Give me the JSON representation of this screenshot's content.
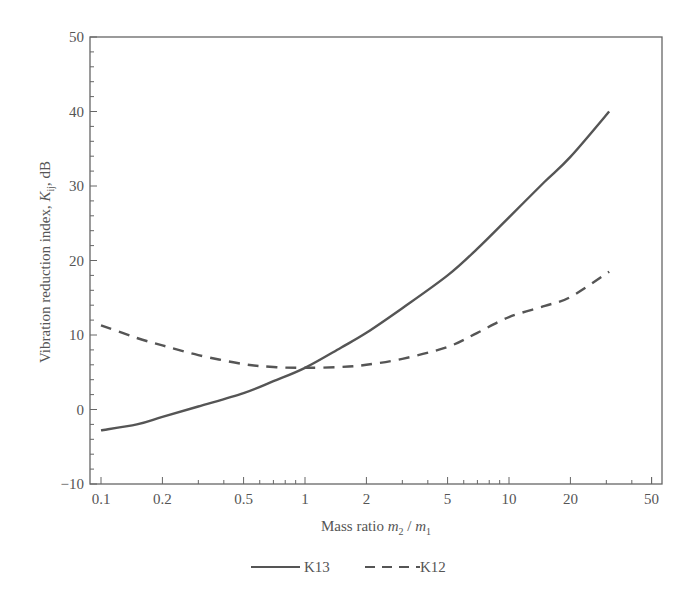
{
  "chart_data": {
    "type": "line",
    "title": "",
    "xlabel": "Mass ratio m2 / m1",
    "xlabel_parts": {
      "prefix": "Mass ratio ",
      "var1": "m",
      "sub1": "2",
      "sep": " / ",
      "var2": "m",
      "sub2": "1"
    },
    "ylabel": "Vibration reduction index, Kij, dB",
    "ylabel_parts": {
      "prefix": "Vibration reduction index, ",
      "var": "K",
      "sub": "ij",
      "suffix": ", dB"
    },
    "xscale": "log",
    "xlim": [
      0.1,
      50
    ],
    "ylim": [
      -10,
      50
    ],
    "xticks": [
      0.1,
      0.2,
      0.5,
      1,
      2,
      5,
      10,
      20,
      50
    ],
    "xtick_labels": [
      "0.1",
      "0.2",
      "0.5",
      "1",
      "2",
      "5",
      "10",
      "20",
      "50"
    ],
    "yticks": [
      -10,
      0,
      10,
      20,
      30,
      40,
      50
    ],
    "ytick_labels": [
      "−10",
      "0",
      "10",
      "20",
      "30",
      "40",
      "50"
    ],
    "grid": false,
    "legend_position": "bottom-center",
    "series": [
      {
        "name": "K13",
        "style": "solid",
        "x": [
          0.1,
          0.15,
          0.2,
          0.3,
          0.5,
          0.7,
          1,
          1.5,
          2,
          3,
          5,
          7,
          10,
          15,
          20,
          31
        ],
        "values": [
          -2.8,
          -2.0,
          -1.0,
          0.4,
          2.2,
          3.8,
          5.6,
          8.3,
          10.3,
          13.6,
          18.0,
          21.6,
          25.8,
          30.6,
          33.9,
          40.0
        ]
      },
      {
        "name": "K12",
        "style": "dashed",
        "x": [
          0.1,
          0.15,
          0.2,
          0.3,
          0.5,
          0.7,
          1,
          1.5,
          2,
          3,
          5,
          7,
          10,
          15,
          20,
          31
        ],
        "values": [
          11.3,
          9.6,
          8.6,
          7.3,
          6.1,
          5.7,
          5.6,
          5.7,
          6.0,
          6.8,
          8.4,
          10.3,
          12.4,
          13.9,
          15.1,
          18.5
        ]
      }
    ]
  },
  "legend": {
    "items": [
      {
        "label": "K13",
        "style": "solid"
      },
      {
        "label": "K12",
        "style": "dashed"
      }
    ]
  },
  "colors": {
    "line": "#555555",
    "axis": "#666666"
  }
}
